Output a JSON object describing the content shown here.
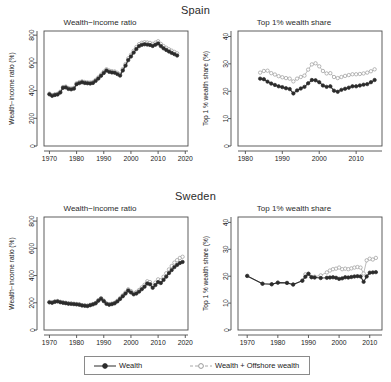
{
  "figure": {
    "countries": [
      {
        "id": "spain",
        "name": "Spain"
      },
      {
        "id": "sweden",
        "name": "Sweden"
      }
    ],
    "legend": {
      "items": [
        {
          "id": "wealth",
          "label": "Wealth",
          "marker": "filled-circle",
          "line": "solid",
          "color": "#2b2b2b"
        },
        {
          "id": "offshore",
          "label": "Wealth + Offshore wealth",
          "marker": "open-circle",
          "line": "dashed",
          "color": "#b0b0b0"
        }
      ]
    }
  },
  "chart_data": [
    {
      "id": "spain-wealth-income-ratio",
      "type": "line",
      "title": "Wealth−income ratio",
      "country": "Spain",
      "xlabel": "",
      "ylabel": "Wealth−income ratio (%)",
      "xlim": [
        1968,
        2021
      ],
      "ylim": [
        0,
        830
      ],
      "xticks": [
        1970,
        1980,
        1990,
        2000,
        2010,
        2020
      ],
      "yticks": [
        0,
        200,
        400,
        600,
        800
      ],
      "grid": false,
      "legend_position": "bottom-outside",
      "x": [
        1970,
        1971,
        1972,
        1973,
        1974,
        1975,
        1976,
        1977,
        1978,
        1979,
        1980,
        1981,
        1982,
        1983,
        1984,
        1985,
        1986,
        1987,
        1988,
        1989,
        1990,
        1991,
        1992,
        1993,
        1994,
        1995,
        1996,
        1997,
        1998,
        1999,
        2000,
        2001,
        2002,
        2003,
        2004,
        2005,
        2006,
        2007,
        2008,
        2009,
        2010,
        2011,
        2012,
        2013,
        2014,
        2015,
        2016,
        2017
      ],
      "series": [
        {
          "name": "Wealth",
          "values": [
            373,
            362,
            368,
            372,
            386,
            420,
            423,
            412,
            409,
            414,
            446,
            454,
            460,
            455,
            453,
            451,
            455,
            470,
            487,
            507,
            527,
            545,
            535,
            531,
            529,
            519,
            508,
            545,
            580,
            620,
            646,
            674,
            700,
            721,
            730,
            734,
            732,
            729,
            722,
            731,
            740,
            721,
            705,
            693,
            682,
            672,
            663,
            653
          ]
        },
        {
          "name": "Wealth + Offshore wealth",
          "values": [
            378,
            367,
            373,
            377,
            392,
            426,
            429,
            418,
            415,
            420,
            453,
            461,
            467,
            462,
            460,
            458,
            462,
            477,
            495,
            515,
            536,
            554,
            544,
            540,
            538,
            528,
            517,
            555,
            591,
            632,
            658,
            687,
            714,
            735,
            745,
            749,
            747,
            744,
            737,
            746,
            756,
            737,
            721,
            709,
            698,
            688,
            679,
            669
          ]
        }
      ]
    },
    {
      "id": "spain-top1-wealth-share",
      "type": "line",
      "title": "Top 1% wealth share",
      "country": "Spain",
      "xlabel": "",
      "ylabel": "Top 1 % wealth share (%)",
      "xlim": [
        1978,
        2017
      ],
      "ylim": [
        0,
        42
      ],
      "xticks": [
        1980,
        1990,
        2000,
        2010
      ],
      "yticks": [
        0,
        10,
        20,
        30,
        40
      ],
      "grid": false,
      "legend_position": "bottom-outside",
      "x": [
        1984,
        1985,
        1986,
        1987,
        1988,
        1989,
        1990,
        1991,
        1992,
        1993,
        1994,
        1995,
        1996,
        1997,
        1998,
        1999,
        2000,
        2001,
        2002,
        2003,
        2004,
        2005,
        2006,
        2007,
        2008,
        2009,
        2010,
        2011,
        2012,
        2013,
        2014,
        2015
      ],
      "series": [
        {
          "name": "Wealth",
          "values": [
            24.6,
            24.4,
            23.5,
            22.8,
            22.3,
            21.8,
            21.5,
            21.1,
            20.8,
            19.2,
            20.3,
            21.0,
            21.6,
            22.9,
            24.1,
            24.0,
            23.3,
            22.1,
            21.6,
            21.8,
            20.2,
            19.8,
            20.5,
            20.9,
            21.3,
            21.8,
            21.8,
            22.1,
            22.4,
            22.6,
            23.3,
            24.1
          ]
        },
        {
          "name": "Wealth + Offshore wealth",
          "values": [
            26.8,
            27.4,
            27.5,
            26.6,
            26.1,
            25.5,
            25.1,
            24.8,
            24.6,
            23.6,
            24.6,
            25.2,
            25.7,
            27.9,
            29.8,
            30.2,
            29.1,
            27.4,
            26.5,
            26.6,
            25.2,
            24.8,
            25.2,
            25.6,
            25.9,
            26.2,
            26.2,
            26.3,
            26.5,
            26.8,
            27.3,
            28.0
          ]
        }
      ]
    },
    {
      "id": "sweden-wealth-income-ratio",
      "type": "line",
      "title": "Wealth−income ratio",
      "country": "Sweden",
      "xlabel": "",
      "ylabel": "Wealth−income ratio (%)",
      "xlim": [
        1968,
        2021
      ],
      "ylim": [
        0,
        830
      ],
      "xticks": [
        1970,
        1980,
        1990,
        2000,
        2010,
        2020
      ],
      "yticks": [
        0,
        200,
        400,
        600,
        800
      ],
      "grid": false,
      "legend_position": "bottom-outside",
      "x": [
        1970,
        1971,
        1972,
        1973,
        1974,
        1975,
        1976,
        1977,
        1978,
        1979,
        1980,
        1981,
        1982,
        1983,
        1984,
        1985,
        1986,
        1987,
        1988,
        1989,
        1990,
        1991,
        1992,
        1993,
        1994,
        1995,
        1996,
        1997,
        1998,
        1999,
        2000,
        2001,
        2002,
        2003,
        2004,
        2005,
        2006,
        2007,
        2008,
        2009,
        2010,
        2011,
        2012,
        2013,
        2014,
        2015,
        2016,
        2017,
        2018,
        2019
      ],
      "series": [
        {
          "name": "Wealth",
          "values": [
            203,
            200,
            207,
            210,
            204,
            200,
            197,
            193,
            192,
            190,
            188,
            186,
            180,
            178,
            176,
            182,
            188,
            196,
            215,
            230,
            212,
            192,
            186,
            190,
            196,
            210,
            228,
            248,
            268,
            290,
            276,
            262,
            268,
            282,
            300,
            318,
            342,
            336,
            310,
            330,
            352,
            345,
            368,
            392,
            418,
            440,
            462,
            478,
            492,
            500
          ]
        },
        {
          "name": "Wealth + Offshore wealth",
          "values": [
            206,
            203,
            210,
            213,
            207,
            203,
            200,
            196,
            195,
            193,
            191,
            189,
            183,
            181,
            179,
            185,
            191,
            199,
            219,
            234,
            216,
            196,
            190,
            194,
            200,
            215,
            234,
            255,
            276,
            299,
            286,
            272,
            279,
            294,
            313,
            332,
            358,
            352,
            326,
            348,
            372,
            366,
            391,
            417,
            445,
            470,
            495,
            513,
            529,
            538
          ]
        }
      ]
    },
    {
      "id": "sweden-top1-wealth-share",
      "type": "line",
      "title": "Top 1% wealth share",
      "country": "Sweden",
      "xlabel": "",
      "ylabel": "Top 1 % wealth share (%)",
      "xlim": [
        1967,
        2014
      ],
      "ylim": [
        0,
        42
      ],
      "xticks": [
        1970,
        1980,
        1990,
        2000,
        2010
      ],
      "yticks": [
        0,
        10,
        20,
        30,
        40
      ],
      "grid": false,
      "legend_position": "bottom-outside",
      "x": [
        1970,
        1975,
        1978,
        1980,
        1983,
        1985,
        1988,
        1989,
        1990,
        1991,
        1992,
        1994,
        1996,
        1997,
        1998,
        1999,
        2000,
        2001,
        2002,
        2003,
        2004,
        2005,
        2006,
        2007,
        2008,
        2009,
        2010,
        2011,
        2012
      ],
      "series": [
        {
          "name": "Wealth",
          "values": [
            20.1,
            17.2,
            17.0,
            17.6,
            17.5,
            16.9,
            18.3,
            19.8,
            20.9,
            19.6,
            19.5,
            19.3,
            19.4,
            19.5,
            19.6,
            19.4,
            19.0,
            19.2,
            19.6,
            19.5,
            19.7,
            19.9,
            20.0,
            19.9,
            17.9,
            19.9,
            21.3,
            21.4,
            21.5
          ]
        },
        {
          "name": "Wealth + Offshore wealth",
          "values": [
            20.1,
            17.2,
            17.0,
            17.6,
            17.5,
            16.9,
            18.4,
            20.7,
            20.9,
            19.7,
            19.8,
            20.3,
            21.4,
            22.1,
            22.6,
            22.8,
            23.2,
            22.6,
            22.8,
            22.6,
            22.9,
            23.2,
            23.4,
            23.2,
            21.0,
            25.9,
            26.5,
            26.2,
            26.8
          ]
        }
      ]
    }
  ]
}
